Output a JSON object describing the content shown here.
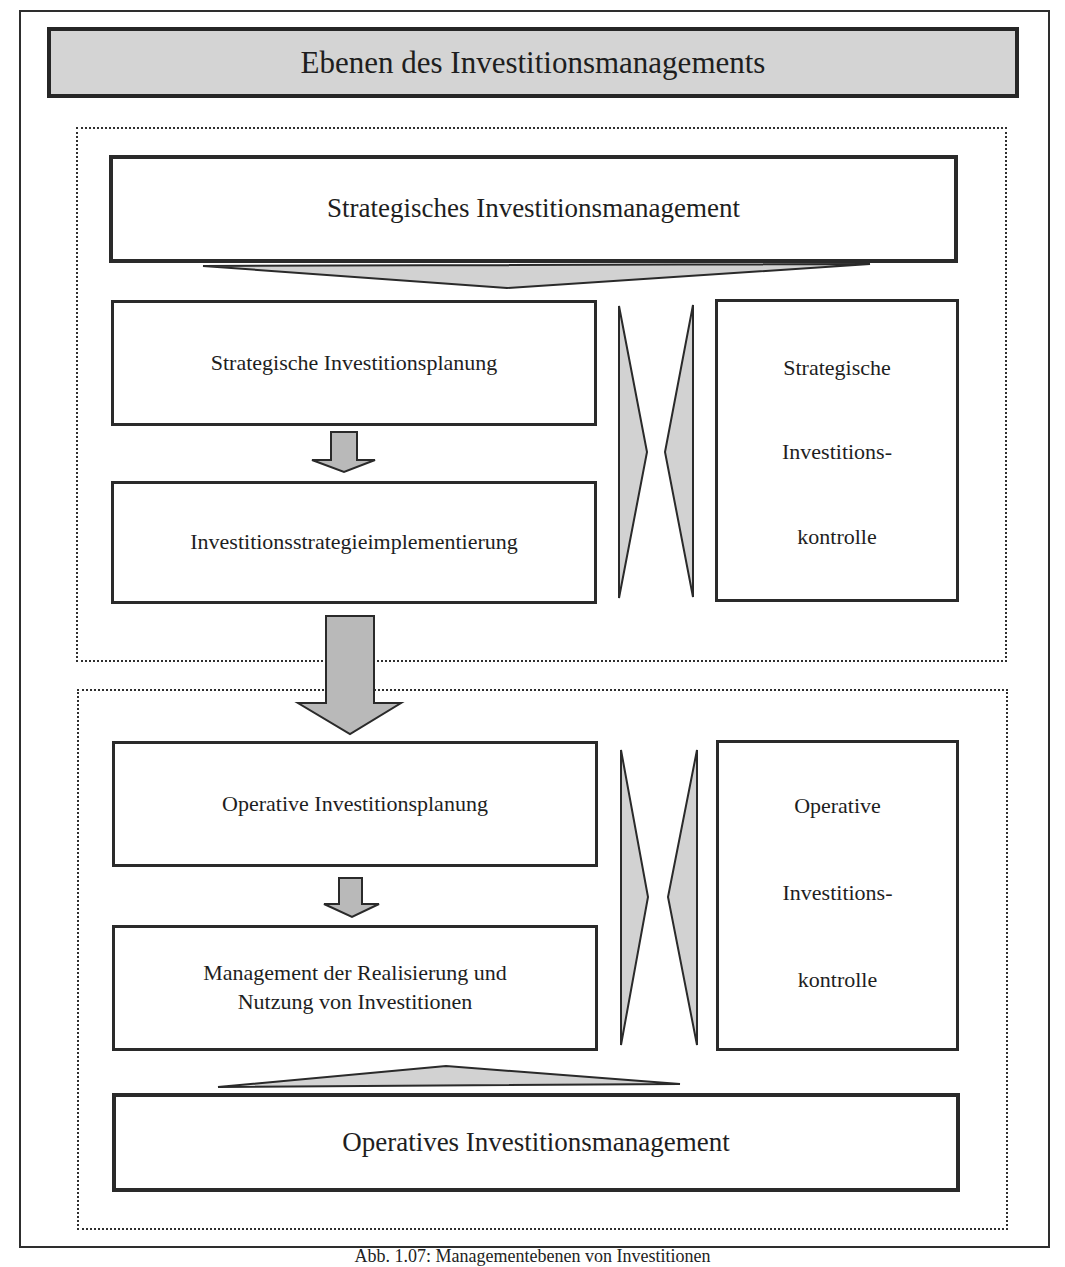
{
  "diagram": {
    "title": "Ebenen des Investitionsmanagements",
    "strategic": {
      "level_label": "Strategisches Investitionsmanagement",
      "planning": "Strategische Investitionsplanung",
      "implementation": "Investitionsstrategieimplementierung",
      "control_lines": [
        "Strategische",
        "Investitions-",
        "kontrolle"
      ]
    },
    "operative": {
      "level_label": "Operatives Investitionsmanagement",
      "planning": "Operative Investitionsplanung",
      "realization_lines": [
        "Management der Realisierung und",
        "Nutzung von Investitionen"
      ],
      "control_lines": [
        "Operative",
        "Investitions-",
        "kontrolle"
      ]
    },
    "caption": "Abb. 1.07: Managementebenen von Investitionen",
    "colors": {
      "title_fill": "#d4d4d4",
      "triangle_fill": "#d2d2d2",
      "arrow_fill": "#b9b9b9",
      "stroke": "#2a2a2a"
    }
  }
}
